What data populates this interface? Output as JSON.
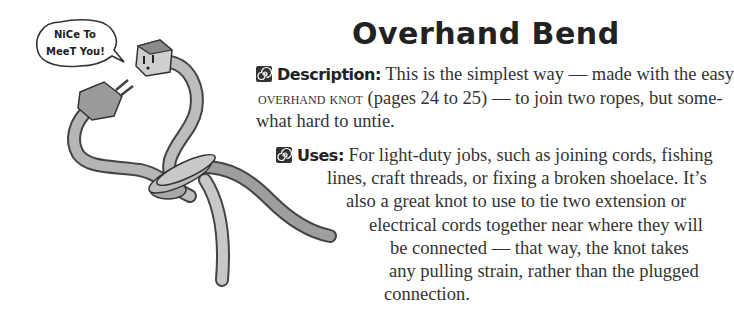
{
  "illustration": {
    "speech_bubble": [
      "NiCe To",
      "MeeT You!"
    ],
    "description": "Two extension cord ends tied together with an overhand bend"
  },
  "title": "Overhand Bend",
  "description": {
    "icon": "spiral-icon",
    "label": "Description:",
    "lines": [
      "This is the simplest way — made with the easy",
      "(pages 24 to 25) — to join two ropes, but some-",
      "what hard to untie."
    ],
    "small_caps": "overhand knot"
  },
  "uses": {
    "icon": "spiral-icon",
    "label": "Uses:",
    "lines": [
      "For light-duty jobs, such as joining cords, fishing",
      "lines, craft threads, or fixing a broken shoelace. It’s",
      "also a great knot to use to tie two extension or",
      "electrical cords together near where they will",
      "be connected — that way, the knot takes",
      "any pulling strain, rather than the plugged",
      "connection."
    ]
  }
}
